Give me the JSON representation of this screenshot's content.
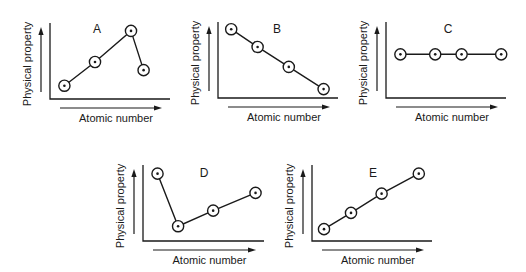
{
  "chart_data": [
    {
      "type": "line",
      "title": "A",
      "xlabel": "Atomic number",
      "ylabel": "Physical property",
      "x": [
        1.2,
        3.75,
        6.75,
        7.8
      ],
      "values": [
        1.8,
        5.0,
        9.2,
        3.9
      ],
      "xlim": [
        0,
        10
      ],
      "ylim": [
        0,
        10
      ],
      "grid": false,
      "legend": "none",
      "marker": "circled-dot"
    },
    {
      "type": "line",
      "title": "B",
      "xlabel": "Atomic number",
      "ylabel": "Physical property",
      "x": [
        1.1,
        3.3,
        5.9,
        8.8
      ],
      "values": [
        9.3,
        6.9,
        4.2,
        1.2
      ],
      "xlim": [
        0,
        10
      ],
      "ylim": [
        0,
        10
      ],
      "grid": false,
      "legend": "none",
      "marker": "circled-dot"
    },
    {
      "type": "line",
      "title": "C",
      "xlabel": "Atomic number",
      "ylabel": "Physical property",
      "x": [
        1.2,
        4.1,
        6.3,
        9.6
      ],
      "values": [
        5.9,
        5.9,
        5.9,
        5.9
      ],
      "xlim": [
        0,
        10
      ],
      "ylim": [
        0,
        10
      ],
      "grid": false,
      "legend": "none",
      "marker": "circled-dot"
    },
    {
      "type": "line",
      "title": "D",
      "xlabel": "Atomic number",
      "ylabel": "Physical property",
      "x": [
        1.2,
        2.9,
        5.8,
        9.3
      ],
      "values": [
        9.1,
        2.0,
        4.1,
        6.5
      ],
      "xlim": [
        0,
        10
      ],
      "ylim": [
        0,
        10
      ],
      "grid": false,
      "legend": "none",
      "marker": "circled-dot"
    },
    {
      "type": "line",
      "title": "E",
      "xlabel": "Atomic number",
      "ylabel": "Physical property",
      "x": [
        1.0,
        3.25,
        5.8,
        8.9
      ],
      "values": [
        1.6,
        3.8,
        6.4,
        9.1
      ],
      "xlim": [
        0,
        10
      ],
      "ylim": [
        0,
        10
      ],
      "grid": false,
      "legend": "none",
      "marker": "circled-dot"
    }
  ]
}
